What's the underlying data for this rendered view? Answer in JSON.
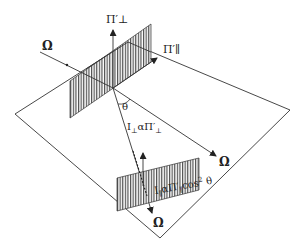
{
  "diagram": {
    "colors": {
      "line": "#333333",
      "hatch": "#444444",
      "background": "#ffffff"
    },
    "labels": {
      "pi_perp": "Π′⊥",
      "pi_par": "Π′∥",
      "omega_incident": "Ω",
      "omega_right": "Ω",
      "omega_bottom": "Ω",
      "theta": "θ",
      "i_perp_base": "I",
      "i_perp_sub": "⊥",
      "i_perp_rest": "αΠ′",
      "i_perp_rest_sub": "⊥",
      "i_par_base": "I",
      "i_par_sub": "∥",
      "i_par_mid": "αΠ′",
      "i_par_mid_sub": "∥",
      "i_par_tail": "cos",
      "i_par_exp": "2",
      "i_par_theta": " θ"
    }
  }
}
